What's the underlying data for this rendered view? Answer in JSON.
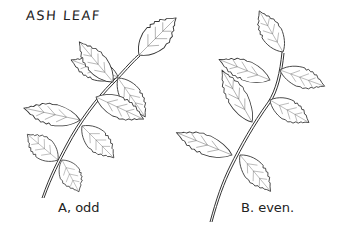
{
  "title": "ASH LEAF",
  "figures": [
    {
      "id": "A",
      "label": "A, odd",
      "type": "odd-pinnate",
      "leaflet_pairs": 3,
      "terminal_leaflet": true
    },
    {
      "id": "B",
      "label": "B. even.",
      "type": "even-pinnate",
      "leaflet_pairs": 3,
      "terminal_leaflet": false
    }
  ],
  "colors": {
    "ink": "#333333",
    "background": "#ffffff"
  }
}
